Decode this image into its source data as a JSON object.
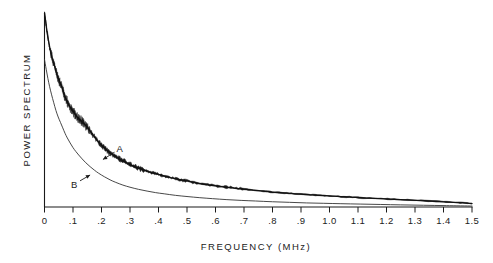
{
  "chart_data": {
    "type": "line",
    "title": "",
    "xlabel": "FREQUENCY  (MHz)",
    "ylabel": "POWER SPECTRUM",
    "xlim": [
      0,
      1.5
    ],
    "ylim": [
      0,
      1
    ],
    "grid": false,
    "legend_position": "inline-annotations",
    "xticks": [
      0,
      0.1,
      0.2,
      0.3,
      0.4,
      0.5,
      0.6,
      0.7,
      0.8,
      0.9,
      1.0,
      1.1,
      1.2,
      1.3,
      1.4,
      1.5
    ],
    "xticklabels": [
      "0",
      ".1",
      ".2",
      ".3",
      ".4",
      ".5",
      ".6",
      ".7",
      ".8",
      ".9",
      "1.0",
      "1.1",
      "1.2",
      "1.3",
      "1.4",
      "1.5"
    ],
    "yticks": [],
    "yticklabels": [],
    "annotations": [
      {
        "text": "A",
        "x": 0.265,
        "y": 0.3,
        "points_to_x": 0.205,
        "points_to_y": 0.245
      },
      {
        "text": "B",
        "x": 0.105,
        "y": 0.118,
        "points_to_x": 0.16,
        "points_to_y": 0.165
      }
    ],
    "series": [
      {
        "name": "A",
        "style": "noisy-thick",
        "x": [
          0.0,
          0.004,
          0.008,
          0.013,
          0.018,
          0.023,
          0.028,
          0.034,
          0.04,
          0.046,
          0.052,
          0.058,
          0.064,
          0.07,
          0.076,
          0.082,
          0.088,
          0.094,
          0.1,
          0.108,
          0.116,
          0.124,
          0.132,
          0.14,
          0.15,
          0.16,
          0.17,
          0.18,
          0.19,
          0.2,
          0.215,
          0.23,
          0.245,
          0.26,
          0.275,
          0.29,
          0.31,
          0.33,
          0.35,
          0.37,
          0.39,
          0.41,
          0.44,
          0.47,
          0.5,
          0.54,
          0.58,
          0.62,
          0.66,
          0.7,
          0.75,
          0.8,
          0.85,
          0.9,
          0.95,
          1.0,
          1.06,
          1.12,
          1.18,
          1.25,
          1.32,
          1.4,
          1.45,
          1.5
        ],
        "y": [
          1.0,
          0.958,
          0.912,
          0.866,
          0.824,
          0.79,
          0.762,
          0.734,
          0.7,
          0.672,
          0.65,
          0.628,
          0.604,
          0.578,
          0.556,
          0.538,
          0.52,
          0.506,
          0.494,
          0.476,
          0.462,
          0.45,
          0.44,
          0.428,
          0.41,
          0.392,
          0.372,
          0.352,
          0.334,
          0.318,
          0.298,
          0.28,
          0.264,
          0.25,
          0.238,
          0.226,
          0.212,
          0.2,
          0.19,
          0.18,
          0.172,
          0.164,
          0.152,
          0.142,
          0.134,
          0.122,
          0.113,
          0.105,
          0.098,
          0.092,
          0.084,
          0.077,
          0.071,
          0.066,
          0.061,
          0.057,
          0.052,
          0.047,
          0.043,
          0.038,
          0.033,
          0.027,
          0.023,
          0.018
        ]
      },
      {
        "name": "B",
        "style": "smooth-thin",
        "x": [
          0.0,
          0.006,
          0.012,
          0.018,
          0.025,
          0.032,
          0.04,
          0.048,
          0.056,
          0.064,
          0.072,
          0.08,
          0.09,
          0.1,
          0.11,
          0.12,
          0.132,
          0.145,
          0.16,
          0.175,
          0.19,
          0.21,
          0.23,
          0.25,
          0.275,
          0.3,
          0.33,
          0.36,
          0.39,
          0.42,
          0.46,
          0.5,
          0.545,
          0.59,
          0.64,
          0.69,
          0.74,
          0.8,
          0.86,
          0.92,
          0.98,
          1.04,
          1.11,
          1.18,
          1.25,
          1.33,
          1.41,
          1.5
        ],
        "y": [
          0.76,
          0.71,
          0.662,
          0.62,
          0.578,
          0.54,
          0.498,
          0.464,
          0.436,
          0.408,
          0.38,
          0.356,
          0.33,
          0.306,
          0.286,
          0.268,
          0.248,
          0.228,
          0.208,
          0.19,
          0.174,
          0.156,
          0.14,
          0.127,
          0.113,
          0.102,
          0.091,
          0.082,
          0.074,
          0.068,
          0.06,
          0.054,
          0.048,
          0.043,
          0.038,
          0.034,
          0.031,
          0.027,
          0.024,
          0.021,
          0.019,
          0.017,
          0.015,
          0.013,
          0.011,
          0.009,
          0.007,
          0.005
        ]
      }
    ],
    "colors": {
      "ink": "#1a1a1a",
      "background": "#ffffff",
      "curve_a": "#111111",
      "curve_b": "#333333"
    }
  }
}
